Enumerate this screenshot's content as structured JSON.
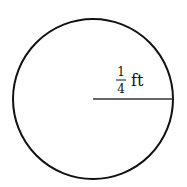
{
  "diagram": {
    "shape": "circle",
    "radius_label": {
      "numerator": "1",
      "denominator": "4",
      "unit": "ft"
    }
  },
  "colors": {
    "stroke": "#111111",
    "background": "#ffffff"
  }
}
